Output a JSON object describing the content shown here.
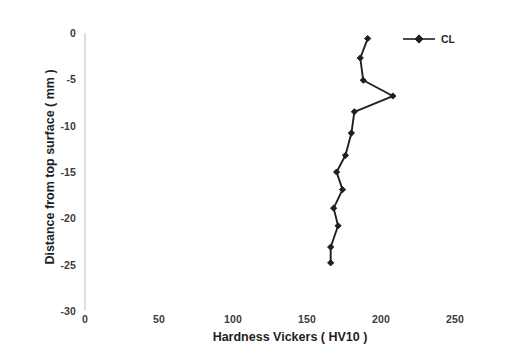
{
  "chart_data": {
    "type": "line",
    "title": "",
    "xlabel": "Hardness Vickers  ( HV10 )",
    "ylabel": "Distance from top surface   ( mm )",
    "xlim": [
      0,
      250
    ],
    "ylim": [
      -30,
      0
    ],
    "xticks": [
      0,
      50,
      100,
      150,
      200,
      250
    ],
    "yticks": [
      0,
      -5,
      -10,
      -15,
      -20,
      -25,
      -30
    ],
    "xtick_labels": [
      "0",
      "50",
      "100",
      "150",
      "200",
      "250"
    ],
    "ytick_labels": [
      "0",
      "-5",
      "-10",
      "-15",
      "-20",
      "-25",
      "-30"
    ],
    "grid": false,
    "legend_position": "top-right",
    "marker": "diamond",
    "series": [
      {
        "name": "CL",
        "color": "#1f1f1f",
        "x": [
          191,
          186,
          188,
          208,
          182,
          180,
          176,
          170,
          174,
          168,
          171,
          166,
          166
        ],
        "y": [
          -0.6,
          -2.7,
          -5.1,
          -6.8,
          -8.5,
          -10.8,
          -13.2,
          -15.0,
          -16.9,
          -18.9,
          -20.8,
          -23.1,
          -24.8
        ]
      }
    ]
  },
  "axes": {
    "x_title": "Hardness Vickers  ( HV10 )",
    "y_title": "Distance from top surface   ( mm )",
    "x_tick_labels": [
      "0",
      "50",
      "100",
      "150",
      "200",
      "250"
    ],
    "y_tick_labels": [
      "0",
      "-5",
      "-10",
      "-15",
      "-20",
      "-25",
      "-30"
    ]
  },
  "legend": {
    "entries": [
      {
        "label": "CL",
        "color": "#1f1f1f"
      }
    ]
  },
  "colors": {
    "series": "#1f1f1f",
    "axis": "#c9c9c9",
    "text": "#2a2a2a",
    "background": "#ffffff"
  }
}
